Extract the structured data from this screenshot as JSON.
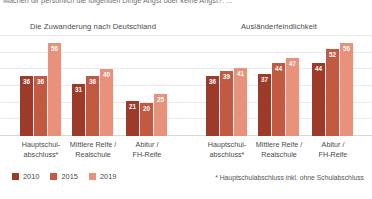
{
  "question": "Machen dir persönlich die folgenden Dinge Angst oder keine Angst?: ...",
  "footnote": "* Hauptschulabschluss inkl. ohne Schulabschluss",
  "legend": {
    "items": [
      {
        "label": "2010",
        "color": "#9E3A28"
      },
      {
        "label": "2015",
        "color": "#C25A42"
      },
      {
        "label": "2019",
        "color": "#E8927C"
      }
    ]
  },
  "categories": [
    "Hauptschul-\nabschluss*",
    "Mittlere Reife /\nRealschule",
    "Abitur /\nFH-Reife"
  ],
  "category_lines": [
    [
      "Hauptschul-",
      "abschluss*"
    ],
    [
      "Mittlere Reife /",
      "Realschule"
    ],
    [
      "Abitur /",
      "FH-Reife"
    ]
  ],
  "chart_data": [
    {
      "type": "bar",
      "title": "Die Zuwanderung nach Deutschland",
      "xlabel": "",
      "ylabel": "",
      "ylim": [
        0,
        60
      ],
      "grid": true,
      "legend_position": "bottom-left",
      "categories": [
        "Hauptschulabschluss*",
        "Mittlere Reife / Realschule",
        "Abitur / FH-Reife"
      ],
      "series": [
        {
          "name": "2010",
          "color": "#9E3A28",
          "values": [
            36,
            31,
            21
          ]
        },
        {
          "name": "2015",
          "color": "#C25A42",
          "values": [
            36,
            36,
            20
          ]
        },
        {
          "name": "2019",
          "color": "#E8927C",
          "values": [
            56,
            40,
            25
          ]
        }
      ]
    },
    {
      "type": "bar",
      "title": "Ausländerfeindlichkeit",
      "xlabel": "",
      "ylabel": "",
      "ylim": [
        0,
        60
      ],
      "grid": true,
      "legend_position": "bottom-left",
      "categories": [
        "Hauptschulabschluss*",
        "Mittlere Reife / Realschule",
        "Abitur / FH-Reife"
      ],
      "series": [
        {
          "name": "2010",
          "color": "#9E3A28",
          "values": [
            36,
            37,
            44
          ]
        },
        {
          "name": "2015",
          "color": "#C25A42",
          "values": [
            39,
            44,
            52
          ]
        },
        {
          "name": "2019",
          "color": "#E8927C",
          "values": [
            41,
            47,
            56
          ]
        }
      ]
    }
  ]
}
